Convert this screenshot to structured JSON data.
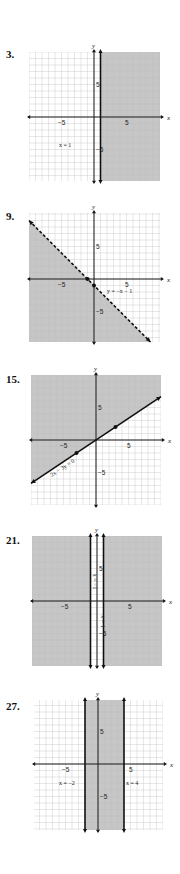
{
  "page": {
    "width": 180,
    "height": 874
  },
  "colors": {
    "shade": "#c6c6c6",
    "shade_grid": "#b3b3b3",
    "grid": "#dcdcdc",
    "axis": "#1a1a1a",
    "boundary": "#111111"
  },
  "graphs": [
    {
      "number": "3.",
      "num_pos": [
        6,
        48
      ],
      "origin": [
        94,
        117
      ],
      "grid_box": [
        29,
        52,
        160,
        181
      ],
      "unit": 6.5,
      "x_label": "x",
      "y_label": "y",
      "ticks": {
        "x_neg": "−5",
        "x_pos": "5",
        "y_pos": "5",
        "y_neg": "−5"
      },
      "shade": {
        "type": "halfplane_x_gt",
        "value": 1
      },
      "boundaries": [
        {
          "type": "vertical",
          "x": 1,
          "dashed": false
        }
      ],
      "points": [],
      "equations": [
        {
          "text": "x = 1",
          "x": -5.4,
          "y": -4.6,
          "rotate": 0
        }
      ]
    },
    {
      "number": "9.",
      "num_pos": [
        6,
        210
      ],
      "origin": [
        94,
        279
      ],
      "grid_box": [
        29,
        213,
        160,
        342
      ],
      "unit": 6.5,
      "x_label": "x",
      "y_label": "y",
      "ticks": {
        "x_neg": "−5",
        "x_pos": "5",
        "y_pos": "5",
        "y_neg": "−5"
      },
      "shade": {
        "type": "below_line",
        "slope": -1,
        "intercept": -1
      },
      "boundaries": [
        {
          "type": "line",
          "slope": -1,
          "intercept": -1,
          "dashed": true
        }
      ],
      "points": [
        [
          -1,
          0
        ],
        [
          0,
          -1
        ]
      ],
      "equations": [
        {
          "text": "y = −x − 1",
          "x": 2.0,
          "y": -2.1,
          "rotate": 0
        }
      ]
    },
    {
      "number": "15.",
      "num_pos": [
        6,
        373
      ],
      "origin": [
        96,
        440
      ],
      "grid_box": [
        31,
        375,
        161,
        505
      ],
      "unit": 6.5,
      "x_label": "x",
      "y_label": "y",
      "ticks": {
        "x_neg": "−5",
        "x_pos": "5",
        "y_pos": "5",
        "y_neg": "−5"
      },
      "shade": {
        "type": "above_line",
        "slope": 0.6667,
        "intercept": 0
      },
      "boundaries": [
        {
          "type": "line",
          "slope": 0.6667,
          "intercept": 0,
          "dashed": false
        }
      ],
      "points": [
        [
          3,
          2
        ],
        [
          -3,
          -2
        ]
      ],
      "equations": [
        {
          "text": "2x − 3y = 0",
          "x": -6.8,
          "y": -5.7,
          "rotate": -33
        }
      ]
    },
    {
      "number": "21.",
      "num_pos": [
        6,
        534
      ],
      "origin": [
        97,
        601
      ],
      "grid_box": [
        32,
        536,
        162,
        666
      ],
      "unit": 6.5,
      "x_label": "x",
      "y_label": "y",
      "ticks": {
        "x_neg": "−5",
        "x_pos": "5",
        "y_pos": "5",
        "y_neg": "−5"
      },
      "shade": {
        "type": "outside_strip",
        "low": -1,
        "high": 1
      },
      "boundaries": [
        {
          "type": "vertical",
          "x": -1,
          "dashed": false
        },
        {
          "type": "vertical",
          "x": 1,
          "dashed": false
        }
      ],
      "points": [],
      "equations": [
        {
          "text": "x = −1",
          "x": -0.55,
          "y": 4.2,
          "rotate": 90
        },
        {
          "text": "x = 1",
          "x": 0.55,
          "y": -2.2,
          "rotate": 90
        }
      ]
    },
    {
      "number": "27.",
      "num_pos": [
        6,
        700
      ],
      "origin": [
        98,
        764
      ],
      "grid_box": [
        34,
        700,
        163,
        830
      ],
      "unit": 6.5,
      "x_label": "x",
      "y_label": "y",
      "ticks": {
        "x_neg": "−5",
        "x_pos": "5",
        "y_pos": "5",
        "y_neg": "−5"
      },
      "shade": {
        "type": "strip",
        "low": -2,
        "high": 4
      },
      "boundaries": [
        {
          "type": "vertical",
          "x": -2,
          "dashed": false
        },
        {
          "type": "vertical",
          "x": 4,
          "dashed": false
        }
      ],
      "points": [],
      "equations": [
        {
          "text": "x = −2",
          "x": -6.0,
          "y": -3.3,
          "rotate": 0
        },
        {
          "text": "x = 4",
          "x": 4.3,
          "y": -3.3,
          "rotate": 0
        }
      ]
    }
  ]
}
